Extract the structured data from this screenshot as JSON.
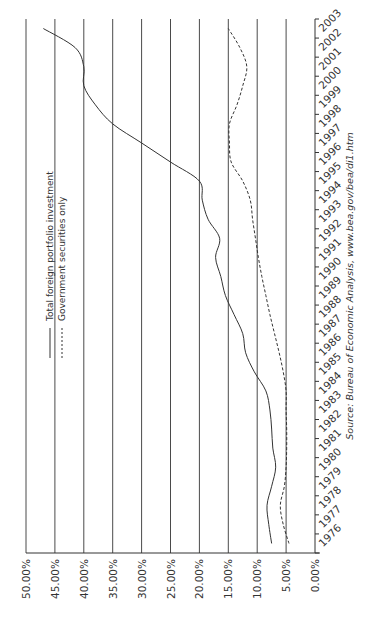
{
  "chart_data": {
    "type": "line",
    "orientation": "rotated-90-ccw",
    "title": "",
    "xlabel": "",
    "ylabel": "",
    "ylim": [
      0,
      50
    ],
    "y_ticks": [
      "0.00%",
      "5.00%",
      "10.00%",
      "15.00%",
      "20.00%",
      "25.00%",
      "30.00%",
      "35.00%",
      "40.00%",
      "45.00%",
      "50.00%"
    ],
    "grid": true,
    "legend_position": "upper-left",
    "x": [
      "1976",
      "1977",
      "1978",
      "1979",
      "1980",
      "1981",
      "1982",
      "1983",
      "1984",
      "1985",
      "1986",
      "1987",
      "1988",
      "1989",
      "1990",
      "1991",
      "1992",
      "1993",
      "1994",
      "1995",
      "1996",
      "1997",
      "1998",
      "1999",
      "2000",
      "2001",
      "2002",
      "2003"
    ],
    "series": [
      {
        "name": "Total foreign portfolio investment",
        "style": "solid",
        "values": [
          7.5,
          8.0,
          8.3,
          7.5,
          6.8,
          7.3,
          7.5,
          7.8,
          8.5,
          10.5,
          12.0,
          12.5,
          14.0,
          15.5,
          16.3,
          17.2,
          16.5,
          18.5,
          19.5,
          20.0,
          25.0,
          30.0,
          35.0,
          38.0,
          40.0,
          40.0,
          41.5,
          47.0
        ]
      },
      {
        "name": "Government securities only",
        "style": "dashed",
        "values": [
          4.5,
          5.5,
          6.0,
          5.3,
          5.0,
          4.9,
          4.9,
          5.0,
          5.0,
          5.5,
          6.2,
          7.0,
          7.8,
          8.5,
          9.2,
          9.8,
          10.3,
          10.8,
          11.2,
          12.5,
          14.5,
          14.8,
          14.8,
          13.5,
          12.5,
          11.8,
          13.0,
          15.0
        ]
      }
    ],
    "annotations": [
      "Source: Bureau of Economic Analysis, www.bea.gov/bea/di1.htm"
    ]
  },
  "legend": {
    "total_label": "Total foreign portfolio investment",
    "gov_label": "Government securities only"
  },
  "source_text": "Source:  Bureau of Economic Analysis, www.bea.gov/bea/di1.htm"
}
